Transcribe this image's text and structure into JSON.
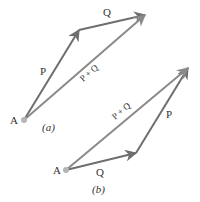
{
  "diagram": {
    "colors": {
      "vector": "#6e6e6e",
      "resultant": "#8a8a8a",
      "point": "#b5b5b5",
      "text": "#333333"
    },
    "panel_a": {
      "caption": "(a)",
      "point_label": "A",
      "vectors": [
        {
          "label": "P",
          "from": [
            24,
            120
          ],
          "to": [
            79,
            30
          ]
        },
        {
          "label": "Q",
          "from": [
            79,
            30
          ],
          "to": [
            145,
            15
          ]
        },
        {
          "label": "P + Q",
          "from": [
            24,
            120
          ],
          "to": [
            145,
            15
          ]
        }
      ]
    },
    "panel_b": {
      "caption": "(b)",
      "point_label": "A",
      "vectors": [
        {
          "label": "Q",
          "from": [
            66,
            170
          ],
          "to": [
            136,
            153
          ]
        },
        {
          "label": "P",
          "from": [
            136,
            153
          ],
          "to": [
            188,
            68
          ]
        },
        {
          "label": "P + Q",
          "from": [
            66,
            170
          ],
          "to": [
            188,
            68
          ]
        }
      ]
    }
  }
}
